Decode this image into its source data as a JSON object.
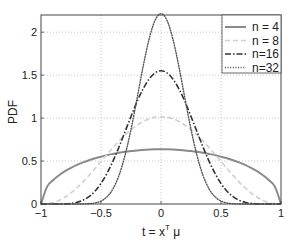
{
  "chart_data": {
    "type": "line",
    "title": "",
    "xlabel": "t = x^T μ",
    "xlabel_parts": {
      "base": "t = x",
      "sup": "T",
      "tail": " μ"
    },
    "ylabel": "PDF",
    "xlim": [
      -1,
      1
    ],
    "ylim": [
      0,
      2.2
    ],
    "grid": true,
    "legend_position": "upper right",
    "x_ticks": [
      -1,
      -0.5,
      0,
      0.5,
      1
    ],
    "x_tick_labels": [
      "−1",
      "−0.5",
      "0",
      "0.5",
      "1"
    ],
    "y_ticks": [
      0,
      0.5,
      1,
      1.5,
      2
    ],
    "y_tick_labels": [
      "0",
      "0.5",
      "1",
      "1.5",
      "2"
    ],
    "x": [
      -1,
      -0.95,
      -0.9,
      -0.85,
      -0.8,
      -0.75,
      -0.7,
      -0.65,
      -0.6,
      -0.55,
      -0.5,
      -0.45,
      -0.4,
      -0.35,
      -0.3,
      -0.25,
      -0.2,
      -0.15,
      -0.1,
      -0.05,
      0,
      0.05,
      0.1,
      0.15,
      0.2,
      0.25,
      0.3,
      0.35,
      0.4,
      0.45,
      0.5,
      0.55,
      0.6,
      0.65,
      0.7,
      0.75,
      0.8,
      0.85,
      0.9,
      0.95,
      1
    ],
    "series": [
      {
        "name": "n = 4",
        "style": "solid",
        "color": "#8a8a8a",
        "width": 2,
        "values": [
          0,
          0.199,
          0.277,
          0.335,
          0.382,
          0.421,
          0.455,
          0.484,
          0.509,
          0.532,
          0.551,
          0.569,
          0.583,
          0.596,
          0.607,
          0.616,
          0.624,
          0.629,
          0.633,
          0.636,
          0.637,
          0.636,
          0.633,
          0.629,
          0.624,
          0.616,
          0.607,
          0.596,
          0.583,
          0.569,
          0.551,
          0.532,
          0.509,
          0.484,
          0.455,
          0.421,
          0.382,
          0.335,
          0.277,
          0.199,
          0
        ]
      },
      {
        "name": "n = 8",
        "style": "dashed",
        "color": "#cfcfcf",
        "width": 1.6,
        "values": [
          0,
          0.003,
          0.016,
          0.041,
          0.079,
          0.129,
          0.189,
          0.257,
          0.333,
          0.413,
          0.495,
          0.577,
          0.657,
          0.733,
          0.803,
          0.865,
          0.917,
          0.96,
          0.991,
          1.01,
          1.016,
          1.01,
          0.991,
          0.96,
          0.917,
          0.865,
          0.803,
          0.733,
          0.657,
          0.577,
          0.495,
          0.413,
          0.333,
          0.257,
          0.189,
          0.129,
          0.079,
          0.041,
          0.016,
          0.003,
          0
        ]
      },
      {
        "name": "n=16",
        "style": "dashdot",
        "color": "#333333",
        "width": 1.6,
        "values": [
          0,
          0,
          0,
          0,
          0.002,
          0.007,
          0.02,
          0.044,
          0.085,
          0.149,
          0.239,
          0.357,
          0.5,
          0.664,
          0.841,
          1.019,
          1.19,
          1.338,
          1.453,
          1.526,
          1.551,
          1.526,
          1.453,
          1.338,
          1.19,
          1.019,
          0.841,
          0.664,
          0.5,
          0.357,
          0.239,
          0.149,
          0.085,
          0.044,
          0.02,
          0.007,
          0.002,
          0,
          0,
          0,
          0
        ]
      },
      {
        "name": "n=32",
        "style": "dotted",
        "color": "#555555",
        "width": 1.4,
        "values": [
          0,
          0,
          0,
          0,
          0,
          0,
          0,
          0.001,
          0.003,
          0.012,
          0.034,
          0.084,
          0.177,
          0.333,
          0.566,
          0.869,
          1.226,
          1.594,
          1.915,
          2.137,
          2.216,
          2.137,
          1.915,
          1.594,
          1.226,
          0.869,
          0.566,
          0.333,
          0.177,
          0.084,
          0.034,
          0.012,
          0.003,
          0.001,
          0,
          0,
          0,
          0,
          0,
          0,
          0
        ]
      }
    ]
  },
  "legend": {
    "items": [
      "n = 4",
      "n = 8",
      "n=16",
      "n=32"
    ]
  }
}
